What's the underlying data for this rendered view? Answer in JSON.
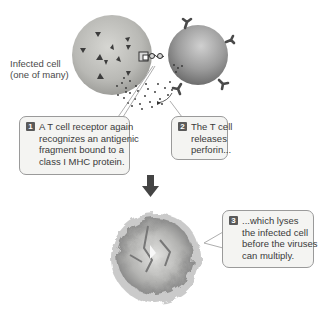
{
  "diagram": {
    "labels": {
      "infected_cell": [
        "Infected cell",
        "(one of many)"
      ]
    },
    "steps": [
      {
        "number": "1",
        "lines": [
          "A T cell receptor again",
          "recognizes an antigenic",
          "fragment bound to a",
          "class I MHC protein."
        ]
      },
      {
        "number": "2",
        "lines": [
          "The T cell",
          "releases",
          "perforin..."
        ]
      },
      {
        "number": "3",
        "lines": [
          "...which lyses",
          "the infected cell",
          "before the viruses",
          "can multiply."
        ]
      }
    ],
    "icons": {
      "arrow": "down-arrow",
      "infected_cell": "infected-cell",
      "t_cell": "t-cell",
      "lysed_cell": "lysed-cell"
    },
    "colors": {
      "infected_cell": "#b9b9b5",
      "t_cell": "#9a9a9a",
      "callout_bg": "#f4f4f2",
      "callout_border": "#9a9a9a",
      "badge": "#5a5a5a",
      "arrow": "#444444"
    }
  }
}
